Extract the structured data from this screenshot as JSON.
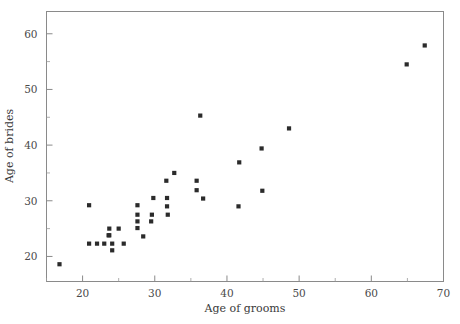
{
  "chart_data": {
    "type": "scatter",
    "title": "",
    "xlabel": "Age of grooms",
    "ylabel": "Age of brides",
    "xlim": [
      15,
      70
    ],
    "ylim": [
      15.5,
      64
    ],
    "grid": false,
    "legend": null,
    "legend_position": "none",
    "marker_style": "filled-square",
    "marker_color": "#2b2b2b",
    "xticks": [
      20,
      30,
      40,
      50,
      60,
      70
    ],
    "yticks": [
      20,
      30,
      40,
      50,
      60
    ],
    "xticks_minor": [
      15,
      25,
      35,
      45,
      55,
      65
    ],
    "yticks_minor": [
      25,
      35,
      45,
      55
    ],
    "x": [
      16.8,
      20.9,
      20.9,
      22.0,
      23.0,
      23.6,
      23.7,
      23.7,
      24.1,
      24.1,
      25.0,
      25.7,
      27.6,
      27.6,
      27.6,
      27.6,
      28.4,
      29.5,
      29.6,
      29.8,
      31.6,
      31.7,
      31.7,
      31.8,
      32.7,
      35.8,
      35.8,
      36.3,
      36.7,
      41.6,
      41.7,
      44.8,
      44.9,
      48.6,
      64.9,
      67.4
    ],
    "y": [
      18.6,
      29.2,
      22.3,
      22.3,
      22.3,
      23.8,
      25.0,
      23.8,
      21.1,
      22.3,
      25.0,
      22.3,
      29.2,
      27.5,
      26.3,
      25.1,
      23.6,
      26.3,
      27.5,
      30.5,
      33.6,
      30.5,
      29.0,
      27.5,
      35.0,
      33.6,
      31.9,
      45.3,
      30.4,
      29.0,
      36.9,
      39.4,
      31.8,
      43.0,
      54.5,
      57.9
    ],
    "points": [
      {
        "x": 16.8,
        "y": 18.6
      },
      {
        "x": 20.9,
        "y": 29.2
      },
      {
        "x": 20.9,
        "y": 22.3
      },
      {
        "x": 22.0,
        "y": 22.3
      },
      {
        "x": 23.0,
        "y": 22.3
      },
      {
        "x": 23.6,
        "y": 23.8
      },
      {
        "x": 23.7,
        "y": 25.0
      },
      {
        "x": 23.7,
        "y": 23.8
      },
      {
        "x": 24.1,
        "y": 21.1
      },
      {
        "x": 24.1,
        "y": 22.3
      },
      {
        "x": 25.0,
        "y": 25.0
      },
      {
        "x": 25.7,
        "y": 22.3
      },
      {
        "x": 27.6,
        "y": 29.2
      },
      {
        "x": 27.6,
        "y": 27.5
      },
      {
        "x": 27.6,
        "y": 26.3
      },
      {
        "x": 27.6,
        "y": 25.1
      },
      {
        "x": 28.4,
        "y": 23.6
      },
      {
        "x": 29.5,
        "y": 26.3
      },
      {
        "x": 29.6,
        "y": 27.5
      },
      {
        "x": 29.8,
        "y": 30.5
      },
      {
        "x": 31.6,
        "y": 33.6
      },
      {
        "x": 31.7,
        "y": 30.5
      },
      {
        "x": 31.7,
        "y": 29.0
      },
      {
        "x": 31.8,
        "y": 27.5
      },
      {
        "x": 32.7,
        "y": 35.0
      },
      {
        "x": 35.8,
        "y": 33.6
      },
      {
        "x": 35.8,
        "y": 31.9
      },
      {
        "x": 36.3,
        "y": 45.3
      },
      {
        "x": 36.7,
        "y": 30.4
      },
      {
        "x": 41.6,
        "y": 29.0
      },
      {
        "x": 41.7,
        "y": 36.9
      },
      {
        "x": 44.8,
        "y": 39.4
      },
      {
        "x": 44.9,
        "y": 31.8
      },
      {
        "x": 48.6,
        "y": 43.0
      },
      {
        "x": 64.9,
        "y": 54.5
      },
      {
        "x": 67.4,
        "y": 57.9
      }
    ]
  },
  "axes": {
    "x_tick_labels": [
      "20",
      "30",
      "40",
      "50",
      "60",
      "70"
    ],
    "y_tick_labels": [
      "20",
      "30",
      "40",
      "50",
      "60"
    ],
    "x_axis_title": "Age of grooms",
    "y_axis_title": "Age of brides"
  }
}
